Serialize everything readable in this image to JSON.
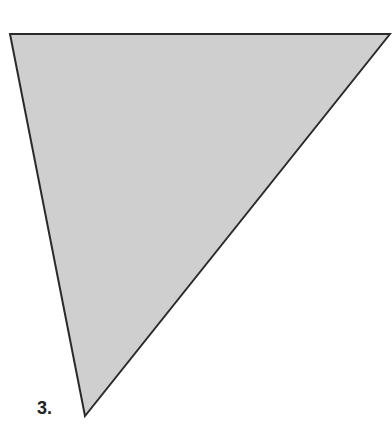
{
  "figure": {
    "label": "3.",
    "shape": "triangle",
    "fill_color": "#cfcfcf",
    "stroke_color": "#2a2a2a",
    "vertices": [
      [
        10,
        34
      ],
      [
        390,
        34
      ],
      [
        85,
        416
      ]
    ]
  }
}
